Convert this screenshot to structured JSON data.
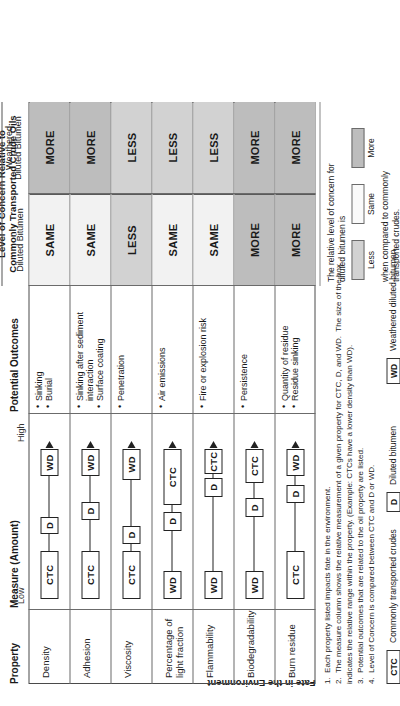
{
  "figure": {
    "side_band_label": "Fate in the Environment",
    "columns": {
      "property": "Property",
      "measure": "Measure (Amount)",
      "measure_low": "Low",
      "measure_high": "High",
      "outcomes": "Potential Outcomes",
      "concern_title": "Level of Concern Relative to\nCommonly Transported Crude Oils",
      "concern_sub_diluted": "Diluted Bitumen",
      "concern_sub_weathered": "Weathered\nDiluted Bitumen"
    },
    "rows": [
      {
        "property": "Density",
        "outcomes": [
          "Sinking",
          "Burial"
        ],
        "measure": [
          {
            "label": "CTC",
            "start": 0.02,
            "end": 0.3
          },
          {
            "label": "D",
            "start": 0.4,
            "end": 0.5
          },
          {
            "label": "WD",
            "start": 0.74,
            "end": 0.9
          }
        ],
        "concern_diluted": "SAME",
        "concern_weathered": "MORE"
      },
      {
        "property": "Adhesion",
        "outcomes": [
          "Sinking after sediment\n  interaction",
          "Surface coating"
        ],
        "measure": [
          {
            "label": "CTC",
            "start": 0.02,
            "end": 0.3
          },
          {
            "label": "D",
            "start": 0.48,
            "end": 0.59
          },
          {
            "label": "WD",
            "start": 0.74,
            "end": 0.9
          }
        ],
        "concern_diluted": "SAME",
        "concern_weathered": "MORE"
      },
      {
        "property": "Viscosity",
        "outcomes": [
          "Penetration"
        ],
        "measure": [
          {
            "label": "CTC",
            "start": 0.02,
            "end": 0.3
          },
          {
            "label": "D",
            "start": 0.34,
            "end": 0.45
          },
          {
            "label": "WD",
            "start": 0.72,
            "end": 0.9
          }
        ],
        "concern_diluted": "LESS",
        "concern_weathered": "LESS"
      },
      {
        "property": "Percentage of\nlight fraction",
        "outcomes": [
          "Air emissions"
        ],
        "measure": [
          {
            "label": "WD",
            "start": 0.02,
            "end": 0.18
          },
          {
            "label": "D",
            "start": 0.42,
            "end": 0.53
          },
          {
            "label": "CTC",
            "start": 0.57,
            "end": 0.9
          }
        ],
        "concern_diluted": "SAME",
        "concern_weathered": "LESS"
      },
      {
        "property": "Flammability",
        "outcomes": [
          "Fire or explosion risk"
        ],
        "measure": [
          {
            "label": "WD",
            "start": 0.02,
            "end": 0.18
          },
          {
            "label": "D",
            "start": 0.62,
            "end": 0.73
          },
          {
            "label": "CTC",
            "start": 0.75,
            "end": 0.9
          }
        ],
        "concern_diluted": "SAME",
        "concern_weathered": "LESS"
      },
      {
        "property": "Biodegradability",
        "outcomes": [
          "Persistence"
        ],
        "measure": [
          {
            "label": "WD",
            "start": 0.02,
            "end": 0.18
          },
          {
            "label": "D",
            "start": 0.5,
            "end": 0.61
          },
          {
            "label": "CTC",
            "start": 0.7,
            "end": 0.9
          }
        ],
        "concern_diluted": "MORE",
        "concern_weathered": "MORE"
      },
      {
        "property": "Burn residue",
        "outcomes": [
          "Quantity of residue",
          "Residue sinking"
        ],
        "measure": [
          {
            "label": "CTC",
            "start": 0.02,
            "end": 0.3
          },
          {
            "label": "D",
            "start": 0.58,
            "end": 0.69
          },
          {
            "label": "WD",
            "start": 0.74,
            "end": 0.9
          }
        ],
        "concern_diluted": "MORE",
        "concern_weathered": "MORE"
      }
    ],
    "legend": {
      "intro": "The relative level of concern for\ndiluted bitumen is",
      "less": "Less",
      "same": "Same",
      "more": "More",
      "outro": "when compared to commonly\ntransported crudes."
    },
    "key": {
      "ctc_code": "CTC",
      "ctc_text": "Commonly transported crudes",
      "d_code": "D",
      "d_text": "Diluted bitumen",
      "wd_code": "WD",
      "wd_text": "Weathered diluted bitumen"
    },
    "notes": [
      "1.  Each property listed impacts fate in the environment.",
      "2.  The measure column shows the relative measurement of a given property for CTC, D, and WD.  The size of the box",
      "indicates the relative range within the property. (Example: CTCs have a lower density than WD).",
      "3.  Potential outcomes that are related to the oil property are listed.",
      "4.  Level of Concern is compared between CTC and D or WD."
    ]
  }
}
